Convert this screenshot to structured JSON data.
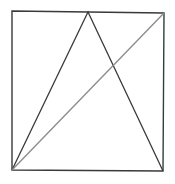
{
  "diagram": {
    "background": "#ffffff",
    "square": {
      "points": [
        [
          12,
          11
        ],
        [
          164,
          13
        ],
        [
          163,
          171
        ],
        [
          12,
          170
        ]
      ],
      "stroke": "#3a3a3a",
      "stroke_width": 1.4
    },
    "triangle": {
      "points": [
        [
          12,
          170
        ],
        [
          88,
          12
        ],
        [
          163,
          171
        ]
      ],
      "stroke": "#3a3a3a",
      "stroke_width": 1.3
    },
    "diagonal": {
      "from": [
        12,
        170
      ],
      "to": [
        164,
        13
      ],
      "stroke": "#8a8a8a",
      "stroke_width": 1.3
    }
  }
}
